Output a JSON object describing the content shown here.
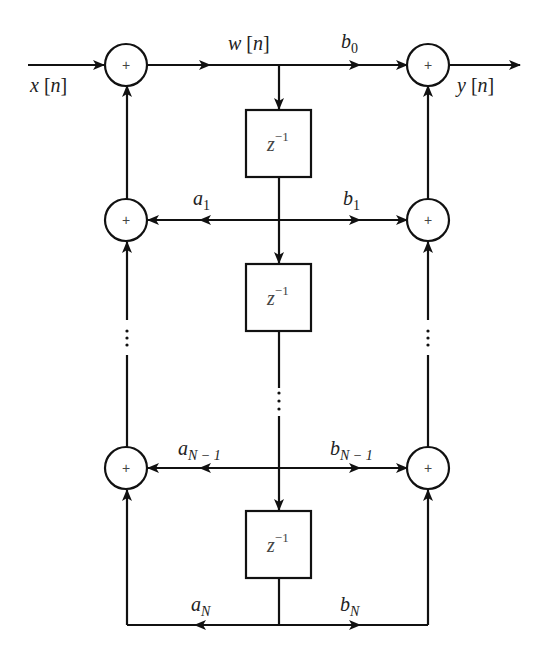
{
  "diagram": {
    "type": "signal-flow-graph",
    "input_label": {
      "var": "x",
      "arg": "n"
    },
    "output_label": {
      "var": "y",
      "arg": "n"
    },
    "state_label": {
      "var": "w",
      "arg": "n"
    },
    "adder_symbol": "+",
    "delay_label": {
      "base": "z",
      "exp": "−1"
    },
    "feedback_coefficients": [
      {
        "base": "a",
        "sub": "1"
      },
      {
        "base": "a",
        "sub": "N − 1"
      },
      {
        "base": "a",
        "sub": "N"
      }
    ],
    "feedforward_coefficients": [
      {
        "base": "b",
        "sub": "0"
      },
      {
        "base": "b",
        "sub": "1"
      },
      {
        "base": "b",
        "sub": "N − 1"
      },
      {
        "base": "b",
        "sub": "N"
      }
    ],
    "ellipsis": "⋮"
  }
}
